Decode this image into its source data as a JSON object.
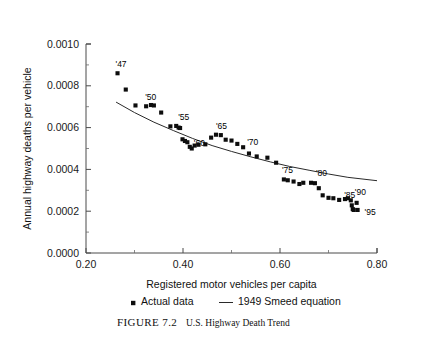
{
  "chart_data": {
    "type": "scatter",
    "title": "",
    "xlabel": "Registered motor vehicles per capita",
    "ylabel": "Annual highway deaths per vehicle",
    "xlim": [
      0.2,
      0.8
    ],
    "ylim": [
      0.0,
      0.001
    ],
    "xticks": [
      "0.20",
      "0.40",
      "0.60",
      "0.80"
    ],
    "xtick_values": [
      0.2,
      0.4,
      0.6,
      0.8
    ],
    "yticks": [
      "0.0000",
      "0.0002",
      "0.0004",
      "0.0006",
      "0.0008",
      "0.0010"
    ],
    "ytick_values": [
      0.0,
      0.0002,
      0.0004,
      0.0006,
      0.0008,
      0.001
    ],
    "grid": false,
    "legend_position": "below-axis",
    "series": [
      {
        "name": "Actual data",
        "marker": "square",
        "color": "#0d0d0d",
        "points": [
          {
            "x": 0.265,
            "y": 0.00086,
            "label": "'47"
          },
          {
            "x": 0.282,
            "y": 0.000782,
            "label": ""
          },
          {
            "x": 0.302,
            "y": 0.000706,
            "label": ""
          },
          {
            "x": 0.324,
            "y": 0.000702,
            "label": "'50"
          },
          {
            "x": 0.334,
            "y": 0.000708,
            "label": ""
          },
          {
            "x": 0.34,
            "y": 0.000706,
            "label": ""
          },
          {
            "x": 0.355,
            "y": 0.000672,
            "label": ""
          },
          {
            "x": 0.374,
            "y": 0.000606,
            "label": ""
          },
          {
            "x": 0.386,
            "y": 0.000608,
            "label": "'55"
          },
          {
            "x": 0.391,
            "y": 0.0006,
            "label": ""
          },
          {
            "x": 0.394,
            "y": 0.000598,
            "label": ""
          },
          {
            "x": 0.399,
            "y": 0.000544,
            "label": ""
          },
          {
            "x": 0.404,
            "y": 0.000536,
            "label": ""
          },
          {
            "x": 0.409,
            "y": 0.00053,
            "label": ""
          },
          {
            "x": 0.414,
            "y": 0.000508,
            "label": "'60"
          },
          {
            "x": 0.418,
            "y": 0.0005,
            "label": ""
          },
          {
            "x": 0.424,
            "y": 0.000514,
            "label": ""
          },
          {
            "x": 0.432,
            "y": 0.000518,
            "label": ""
          },
          {
            "x": 0.446,
            "y": 0.00052,
            "label": ""
          },
          {
            "x": 0.458,
            "y": 0.000552,
            "label": ""
          },
          {
            "x": 0.468,
            "y": 0.000566,
            "label": "'65"
          },
          {
            "x": 0.478,
            "y": 0.000564,
            "label": ""
          },
          {
            "x": 0.488,
            "y": 0.000542,
            "label": ""
          },
          {
            "x": 0.5,
            "y": 0.000538,
            "label": ""
          },
          {
            "x": 0.512,
            "y": 0.000522,
            "label": ""
          },
          {
            "x": 0.524,
            "y": 0.000506,
            "label": "'70"
          },
          {
            "x": 0.536,
            "y": 0.000476,
            "label": ""
          },
          {
            "x": 0.552,
            "y": 0.000462,
            "label": ""
          },
          {
            "x": 0.574,
            "y": 0.000456,
            "label": ""
          },
          {
            "x": 0.592,
            "y": 0.000432,
            "label": ""
          },
          {
            "x": 0.608,
            "y": 0.000352,
            "label": "'75"
          },
          {
            "x": 0.616,
            "y": 0.000348,
            "label": ""
          },
          {
            "x": 0.628,
            "y": 0.000342,
            "label": ""
          },
          {
            "x": 0.64,
            "y": 0.00033,
            "label": ""
          },
          {
            "x": 0.648,
            "y": 0.000336,
            "label": ""
          },
          {
            "x": 0.664,
            "y": 0.000336,
            "label": ""
          },
          {
            "x": 0.672,
            "y": 0.000334,
            "label": "'80"
          },
          {
            "x": 0.68,
            "y": 0.00031,
            "label": ""
          },
          {
            "x": 0.688,
            "y": 0.000276,
            "label": ""
          },
          {
            "x": 0.7,
            "y": 0.000264,
            "label": ""
          },
          {
            "x": 0.71,
            "y": 0.000262,
            "label": ""
          },
          {
            "x": 0.722,
            "y": 0.000254,
            "label": "'85"
          },
          {
            "x": 0.734,
            "y": 0.000258,
            "label": ""
          },
          {
            "x": 0.74,
            "y": 0.000262,
            "label": ""
          },
          {
            "x": 0.746,
            "y": 0.000252,
            "label": "'90"
          },
          {
            "x": 0.748,
            "y": 0.000228,
            "label": ""
          },
          {
            "x": 0.75,
            "y": 0.00021,
            "label": ""
          },
          {
            "x": 0.752,
            "y": 0.000206,
            "label": ""
          },
          {
            "x": 0.758,
            "y": 0.00024,
            "label": ""
          },
          {
            "x": 0.76,
            "y": 0.000206,
            "label": "'95"
          }
        ]
      },
      {
        "name": "1949 Smeed equation",
        "marker": "line",
        "color": "#2a2a2a",
        "points": [
          {
            "x": 0.262,
            "y": 0.000722
          },
          {
            "x": 0.3,
            "y": 0.000672
          },
          {
            "x": 0.34,
            "y": 0.000626
          },
          {
            "x": 0.38,
            "y": 0.000586
          },
          {
            "x": 0.42,
            "y": 0.000548
          },
          {
            "x": 0.46,
            "y": 0.000514
          },
          {
            "x": 0.5,
            "y": 0.000486
          },
          {
            "x": 0.54,
            "y": 0.00046
          },
          {
            "x": 0.58,
            "y": 0.000436
          },
          {
            "x": 0.62,
            "y": 0.000414
          },
          {
            "x": 0.66,
            "y": 0.000396
          },
          {
            "x": 0.7,
            "y": 0.000378
          },
          {
            "x": 0.74,
            "y": 0.000362
          },
          {
            "x": 0.8,
            "y": 0.000346
          }
        ]
      }
    ]
  },
  "legend": {
    "items": [
      {
        "label": "Actual data",
        "symbol": "square"
      },
      {
        "label": "1949 Smeed equation",
        "symbol": "line"
      }
    ]
  },
  "caption": {
    "figure_number": "FIGURE 7.2",
    "text": "U.S. Highway Death Trend"
  }
}
